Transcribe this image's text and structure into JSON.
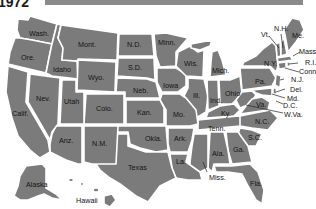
{
  "title": "1972",
  "colors": {
    "state_fill": "#7b7b7b",
    "border": "#ffffff",
    "label": "#141414",
    "title_bar": "#8a8a8a"
  },
  "states": {
    "wash": "Wash.",
    "ore": "Ore.",
    "idaho": "Idaho",
    "mont": "Mont.",
    "wyo": "Wyo.",
    "nd": "N.D.",
    "sd": "S.D.",
    "neb": "Neb.",
    "minn": "Minn.",
    "iowa": "Iowa",
    "wis": "Wis.",
    "mich": "Mich.",
    "ill": "Ill.",
    "ind": "Ind.",
    "ohio": "Ohio",
    "pa": "Pa.",
    "ny": "N.Y.",
    "vt": "Vt.",
    "nh": "N.H.",
    "me": "Me.",
    "mass": "Mass.",
    "ri": "R.I.",
    "conn": "Conn.",
    "nj": "N.J.",
    "del": "Del.",
    "md": "Md.",
    "dc": "D.C.",
    "wva": "W.Va.",
    "va": "Va.",
    "nc": "N.C.",
    "sc": "S.C.",
    "ga": "Ga.",
    "fla": "Fla.",
    "ala": "Ala.",
    "miss": "Miss.",
    "tenn": "Tenn.",
    "ky": "Ky.",
    "mo": "Mo.",
    "ark": "Ark.",
    "la": "La.",
    "kan": "Kan.",
    "okla": "Okla.",
    "texas": "Texas",
    "colo": "Colo.",
    "nm": "N.M.",
    "nev": "Nev.",
    "utah": "Utah",
    "anz": "Anz.",
    "calif": "Calif.",
    "alaska": "Alaska",
    "hawaii": "Hawaii"
  }
}
